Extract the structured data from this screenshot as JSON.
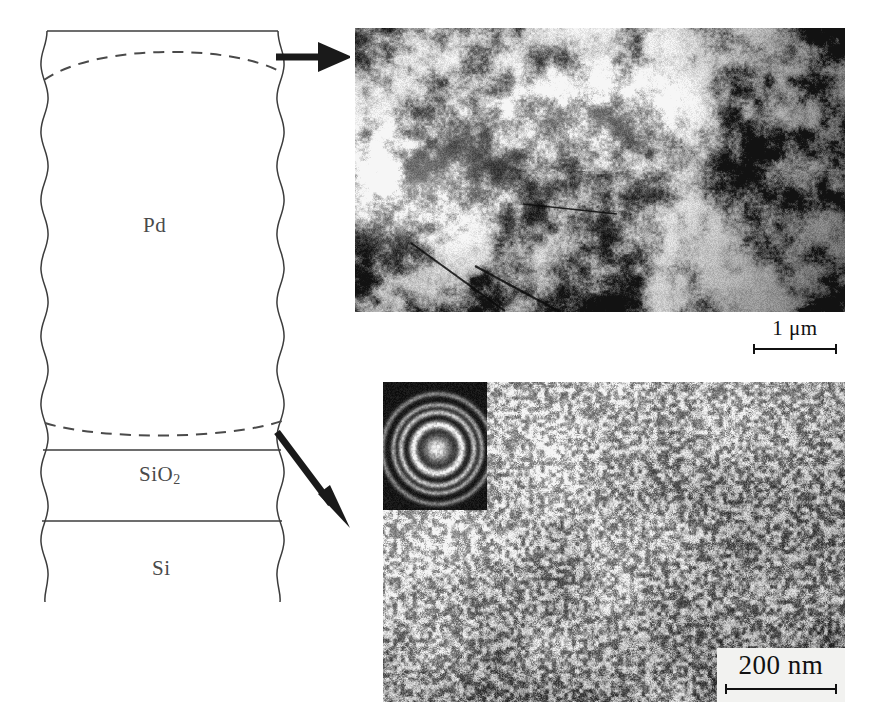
{
  "figure": {
    "kind": "tem-micrograph-figure",
    "background_color": "#ffffff",
    "width": 873,
    "height": 722
  },
  "schematic": {
    "name": "cross-section-stack-schematic",
    "line_color": "#3c3c3c",
    "dashed_line_color": "#4a4a4a",
    "layers": [
      {
        "id": "pd",
        "label": "Pd",
        "label_text": "Pd"
      },
      {
        "id": "sio2",
        "label_text": "SiO",
        "subscript": "2"
      },
      {
        "id": "si",
        "label": "Si",
        "label_text": "Si"
      }
    ],
    "labels": {
      "pd": "Pd",
      "sio2_main": "SiO",
      "sio2_sub": "2",
      "si": "Si"
    },
    "dashed_arcs": [
      {
        "name": "top-surface-dashed-arc",
        "description": "dashed arc just below the Pd top surface"
      },
      {
        "name": "pd-sio2-interface-dashed-arc",
        "description": "dashed arc just above the Pd / SiO2 interface"
      }
    ],
    "edges": {
      "left": "wavy",
      "right": "wavy",
      "top": "straight",
      "bottom": "open"
    }
  },
  "arrows": [
    {
      "name": "arrow-to-top-micrograph",
      "direction": "horizontal-right",
      "from": "pd-top-surface",
      "to": "top-micrograph",
      "color": "#1a1a1a"
    },
    {
      "name": "arrow-to-bottom-micrograph",
      "direction": "diagonal-down-right",
      "from": "pd-sio2-interface",
      "to": "bottom-micrograph",
      "color": "#1a1a1a"
    }
  ],
  "micrographs": [
    {
      "id": "top",
      "name": "top-micrograph",
      "description": "High contrast plan-view TEM image of Pd surface showing large bright grains and dark regions",
      "scalebar": {
        "value": "1",
        "unit": "μm",
        "text": "1 μm"
      },
      "inset": null
    },
    {
      "id": "bottom",
      "name": "bottom-micrograph",
      "description": "Fine-grained nanocrystalline TEM image of the Pd / SiO2 interface region",
      "scalebar": {
        "value": "200",
        "unit": "nm",
        "text": "200 nm"
      },
      "inset": {
        "name": "saed-diffraction-inset",
        "type": "selected-area-electron-diffraction",
        "description": "Dark-field diffraction pattern with bright central spot and concentric rings",
        "ring_count": 4,
        "background_color": "#0d0d0d",
        "ring_color": "#e8e8e8"
      }
    }
  ]
}
